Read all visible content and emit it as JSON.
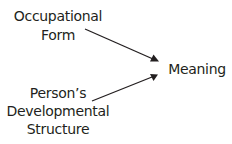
{
  "diagram": {
    "nodes": {
      "occupational_form": {
        "line1": "Occupational",
        "line2": "Form"
      },
      "developmental_structure": {
        "line1": "Person’s",
        "line2": "Developmental",
        "line3": "Structure"
      },
      "meaning": {
        "label": "Meaning"
      }
    },
    "edges": [
      {
        "from": "Occupational Form",
        "to": "Meaning"
      },
      {
        "from": "Person’s Developmental Structure",
        "to": "Meaning"
      }
    ],
    "colors": {
      "text": "#231f20",
      "arrow": "#231f20",
      "background": "#ffffff"
    }
  }
}
